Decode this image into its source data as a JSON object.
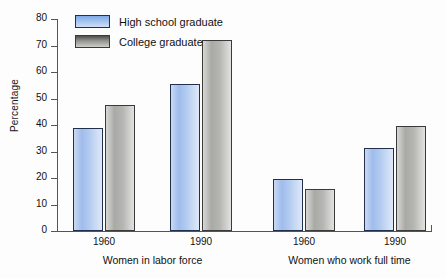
{
  "chart_data": {
    "type": "bar",
    "title": "",
    "xlabel": "",
    "ylabel": "Percentage",
    "ylim": [
      0,
      80
    ],
    "yticks": [
      0,
      10,
      20,
      30,
      40,
      50,
      60,
      70,
      80
    ],
    "grid": false,
    "legend_position": "top-left",
    "categories": [
      "1960",
      "1990",
      "1960",
      "1990"
    ],
    "groups": [
      {
        "group_label": "Women in labor force",
        "categories": [
          "1960",
          "1990"
        ]
      },
      {
        "group_label": "Women who work full time",
        "categories": [
          "1960",
          "1990"
        ]
      }
    ],
    "series": [
      {
        "name": "High school graduate",
        "color": "#9fbced",
        "values": [
          39,
          55.5,
          19.5,
          31.5
        ]
      },
      {
        "name": "College graduate",
        "color": "#a9a9a6",
        "values": [
          47.5,
          72,
          16,
          39.8
        ]
      }
    ]
  },
  "legend": {
    "items": [
      {
        "label": "High school graduate",
        "swatch": "blue"
      },
      {
        "label": "College graduate",
        "swatch": "gray"
      }
    ]
  },
  "axis": {
    "y_title": "Percentage",
    "y_tick_labels": [
      "80",
      "70",
      "60",
      "50",
      "40",
      "30",
      "20",
      "10",
      "0"
    ]
  },
  "x_axis": {
    "years": [
      "1960",
      "1990",
      "1960",
      "1990"
    ],
    "group_labels": [
      "Women in labor force",
      "Women who work full time"
    ]
  }
}
